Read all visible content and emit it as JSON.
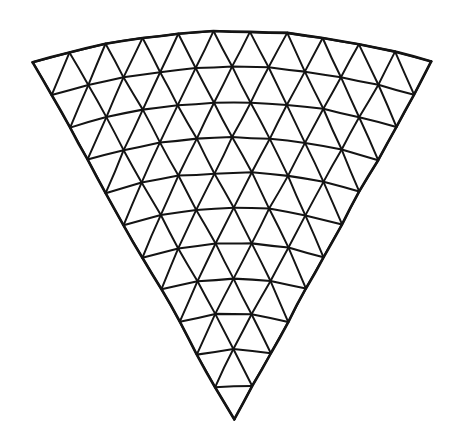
{
  "figure": {
    "background_color": "#ffffff",
    "line_color": "#141414",
    "apex_position": "bottom-center",
    "arc_side": "top"
  },
  "chart_data": {
    "type": "diagram",
    "frequency": 11,
    "rows": 11,
    "row_segment_counts": [
      1,
      2,
      3,
      4,
      5,
      6,
      7,
      8,
      9,
      10,
      11
    ],
    "line_families": [
      "arcs",
      "left-diagonals",
      "right-diagonals"
    ],
    "arc_count": 11,
    "triangle_count": 121,
    "vertex_count": 78,
    "geometry": {
      "apex": {
        "x": 234.0,
        "y": 419.0
      },
      "corner_left": {
        "x": 33.0,
        "y": 63.0
      },
      "corner_right": {
        "x": 432.0,
        "y": 62.0
      },
      "top_arc_mid": {
        "x": 235.0,
        "y": 32.0
      },
      "arc_center": {
        "x": 234.5,
        "y": 770.0
      },
      "arc_bulge_px": 31.0,
      "row_y_centerline": [
        419,
        387,
        352,
        314,
        275,
        236,
        196,
        155,
        114,
        74,
        32
      ]
    },
    "style": {
      "stroke_width_arc": 2.05,
      "stroke_width_diagonal": 1.95,
      "stroke_width_outline": 2.6,
      "grid": false,
      "legend": false,
      "axes": false,
      "labels": []
    },
    "xlabel": "",
    "ylabel": "",
    "annotations": []
  }
}
